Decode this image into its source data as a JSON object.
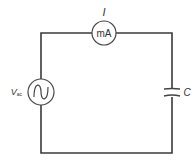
{
  "diagram": {
    "type": "circuit",
    "components": {
      "ammeter": {
        "label": "mA",
        "current_label": "I"
      },
      "source": {
        "label": "V",
        "subscript": "ac",
        "symbol": "sine-wave"
      },
      "capacitor": {
        "label": "C"
      }
    },
    "colors": {
      "wire": "#3a3a3a",
      "text": "#333333",
      "background": "#ffffff"
    }
  }
}
